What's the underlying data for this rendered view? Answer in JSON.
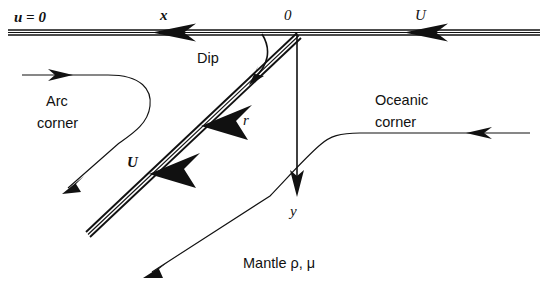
{
  "figure": {
    "background_color": "#ffffff",
    "ink_color": "#111111",
    "width": 546,
    "height": 290
  },
  "labels": {
    "u_zero": "u = 0",
    "x_axis": "x",
    "origin": "0",
    "u_plate_right": "U",
    "dip": "Dip",
    "r_radial": "r",
    "u_slab": "U",
    "arc_corner_line1": "Arc",
    "arc_corner_line2": "corner",
    "oceanic_corner_line1": "Oceanic",
    "oceanic_corner_line2": "corner",
    "y_axis": "y",
    "mantle": "Mantle ρ, μ"
  },
  "geometry": {
    "surface_y": 32,
    "origin_x": 297,
    "origin_y": 32,
    "slab_dip_degrees": 45,
    "slab_end_x": 85,
    "slab_end_y": 236,
    "y_axis_tip_y": 195
  },
  "icons": {
    "arrow_left_surface_mid": "arrow-left-icon",
    "arrow_left_surface_right": "arrow-left-icon",
    "arrow_down_y_axis": "arrow-down-icon",
    "arrow_downleft_slab_upper": "arrow-downleft-icon",
    "arrow_downleft_slab_lower": "arrow-downleft-icon",
    "arrow_dip_curve": "curved-arrow-icon",
    "arrow_right_arc_inflow": "arrow-right-icon",
    "arrow_downleft_arc_outflow": "arrow-downleft-icon",
    "arrow_left_oceanic_inflow": "arrow-left-icon",
    "arrow_downleft_oceanic_outflow": "arrow-downleft-icon"
  }
}
